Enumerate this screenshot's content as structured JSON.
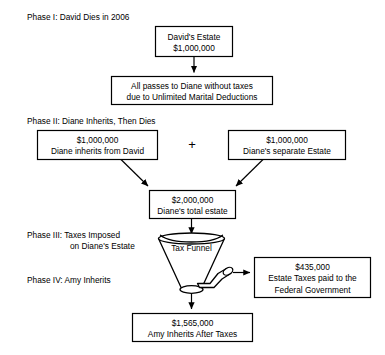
{
  "phases": [
    {
      "id": "phase-1",
      "line1": "Phase I:  David Dies in 2006",
      "line2": ""
    },
    {
      "id": "phase-2",
      "line1": "Phase II: Diane Inherits, Then Dies",
      "line2": ""
    },
    {
      "id": "phase-3",
      "line1": "Phase III:  Taxes Imposed",
      "line2": "on Diane's Estate"
    },
    {
      "id": "phase-4",
      "line1": "Phase IV:  Amy Inherits",
      "line2": ""
    }
  ],
  "boxes": {
    "davids_estate": {
      "line1": "David's Estate",
      "line2": "$1,000,000"
    },
    "marital_deduction": {
      "line1": "All passes to Diane without taxes",
      "line2": "due to Unlimited Marital Deductions"
    },
    "inherits_from_david": {
      "line1": "$1,000,000",
      "line2": "Diane inherits from David"
    },
    "separate_estate": {
      "line1": "$1,000,000",
      "line2": "Diane's separate Estate"
    },
    "total_estate": {
      "line1": "$2,000,000",
      "line2": "Diane's total estate"
    },
    "estate_taxes": {
      "line1": "$435,000",
      "line2": "Estate Taxes paid to the",
      "line3": "Federal Government"
    },
    "amy_inherits": {
      "line1": "$1,565,000",
      "line2": "Amy Inherits After Taxes"
    }
  },
  "funnel": {
    "label": "Tax Funnel"
  },
  "operators": {
    "plus": "+"
  },
  "colors": {
    "stroke": "#000000",
    "fill": "#ffffff",
    "text": "#000000"
  }
}
